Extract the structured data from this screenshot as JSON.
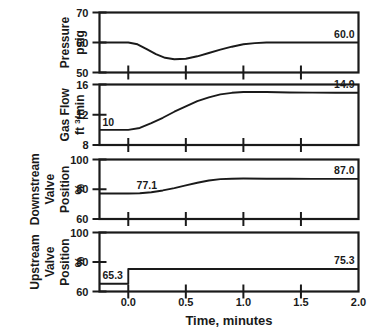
{
  "chart_data": {
    "type": "line",
    "title": "",
    "xlabel": "Time, minutes",
    "xlim": [
      -0.25,
      2.0
    ],
    "xticks": [
      0.0,
      0.5,
      1.0,
      1.5,
      2.0
    ],
    "xtick_labels": [
      "0.0",
      "0.5",
      "1.0",
      "1.5",
      "2.0"
    ],
    "grid": false,
    "legend": "none",
    "panels": [
      {
        "id": "pressure",
        "ylabel_lines": [
          "Pressure",
          "psig"
        ],
        "ylim": [
          50,
          70
        ],
        "yticks": [
          50,
          60,
          70
        ],
        "ytick_labels": [
          "50",
          "60",
          "70"
        ],
        "start_label": "",
        "end_label": "60.0",
        "series_name": "Pressure",
        "x": [
          -0.25,
          0.0,
          0.08,
          0.16,
          0.24,
          0.32,
          0.4,
          0.5,
          0.6,
          0.7,
          0.8,
          0.9,
          1.0,
          1.1,
          1.2,
          1.4,
          1.6,
          1.8,
          2.0
        ],
        "y": [
          60.0,
          60.0,
          59.4,
          57.8,
          56.1,
          54.9,
          54.4,
          54.6,
          55.4,
          56.5,
          57.6,
          58.6,
          59.4,
          59.8,
          60.0,
          60.0,
          60.0,
          60.0,
          60.0
        ]
      },
      {
        "id": "gas-flow",
        "ylabel_lines": [
          "Gas Flow",
          "ft 3/min"
        ],
        "ylabel_sup": "3",
        "ylim": [
          8,
          16
        ],
        "yticks": [
          8,
          12,
          16
        ],
        "ytick_labels": [
          "8",
          "12",
          "16"
        ],
        "start_label": "10",
        "end_label": "14.9",
        "series_name": "Gas Flow",
        "x": [
          -0.25,
          0.0,
          0.1,
          0.2,
          0.3,
          0.4,
          0.5,
          0.6,
          0.7,
          0.8,
          0.9,
          1.0,
          1.1,
          1.2,
          1.4,
          1.6,
          1.8,
          2.0
        ],
        "y": [
          10.0,
          10.0,
          10.25,
          10.9,
          11.6,
          12.4,
          13.1,
          13.8,
          14.3,
          14.7,
          14.9,
          15.0,
          15.0,
          15.0,
          14.95,
          14.93,
          14.91,
          14.9
        ]
      },
      {
        "id": "downstream-valve",
        "ylabel_lines": [
          "Downstream",
          "Valve",
          "Position",
          "%"
        ],
        "ylim": [
          60,
          100
        ],
        "yticks": [
          60,
          80,
          100
        ],
        "ytick_labels": [
          "60",
          "80",
          "100"
        ],
        "start_label": "77.1",
        "end_label": "87.0",
        "series_name": "Downstream Valve Position",
        "x": [
          -0.25,
          0.0,
          0.1,
          0.2,
          0.3,
          0.4,
          0.5,
          0.6,
          0.7,
          0.8,
          0.9,
          1.0,
          1.2,
          1.4,
          1.6,
          1.8,
          2.0
        ],
        "y": [
          77.1,
          77.1,
          77.3,
          78.0,
          79.2,
          80.8,
          82.6,
          84.4,
          85.9,
          86.8,
          87.1,
          87.2,
          87.1,
          87.05,
          87.0,
          87.0,
          87.0
        ]
      },
      {
        "id": "upstream-valve",
        "ylabel_lines": [
          "Upstream",
          "Valve",
          "Position",
          "%"
        ],
        "ylim": [
          60,
          100
        ],
        "yticks": [
          60,
          80,
          100
        ],
        "ytick_labels": [
          "60",
          "80",
          "100"
        ],
        "start_label": "65.3",
        "end_label": "75.3",
        "series_name": "Upstream Valve Position",
        "x": [
          -0.25,
          0.0,
          0.0,
          2.0
        ],
        "y": [
          65.3,
          65.3,
          75.3,
          75.3
        ]
      }
    ]
  },
  "colors": {
    "line": "#1a1a1a",
    "frame": "#1a1a1a",
    "background": "#ffffff"
  }
}
